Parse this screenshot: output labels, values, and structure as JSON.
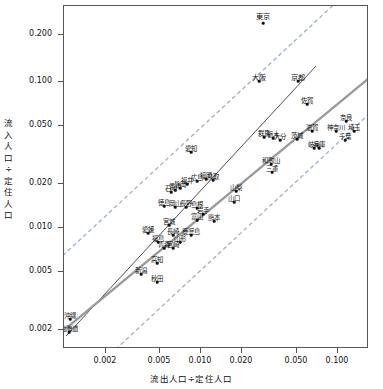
{
  "chart_data": {
    "type": "scatter",
    "title": "",
    "xlabel": "流出人口÷定住人口",
    "ylabel": "流入人口÷定住人口",
    "xscale": "log",
    "yscale": "log",
    "xlim": [
      0.0015,
      0.17
    ],
    "ylim": [
      0.0013,
      0.26
    ],
    "xticks": [
      "0.002",
      "0.005",
      "0.010",
      "0.020",
      "0.050",
      "0.100"
    ],
    "xtick_values": [
      0.002,
      0.005,
      0.01,
      0.02,
      0.05,
      0.1
    ],
    "yticks": [
      "0.200",
      "0.100",
      "0.050",
      "0.020",
      "0.010",
      "0.005",
      "0.002"
    ],
    "ytick_values": [
      0.2,
      0.1,
      0.05,
      0.02,
      0.01,
      0.005,
      0.002
    ],
    "grid": false,
    "legend": "none",
    "annotation": {
      "text": "相関係数: 0.852   p: 0.000 ***",
      "correlation": 0.852,
      "p_value": 0.0,
      "significance": "***"
    },
    "lines": [
      {
        "name": "regression-line",
        "style": "solid",
        "color": "#333333",
        "width": 0.9
      },
      {
        "name": "identity-line",
        "style": "solid",
        "color": "#9a9a9a",
        "width": 2.2
      },
      {
        "name": "upper-confidence-band",
        "style": "dashed",
        "color": "#9fb0c4",
        "width": 1.2
      },
      {
        "name": "lower-confidence-band",
        "style": "dashed",
        "color": "#9fb0c4",
        "width": 1.2
      }
    ],
    "points": [
      {
        "label": "東京",
        "x": 0.0215,
        "y": 0.23,
        "px": 262,
        "py": 22,
        "lx": 262,
        "ly": 15,
        "size": "big"
      },
      {
        "label": "大阪",
        "x": 0.0128,
        "y": 0.074,
        "px": 258,
        "py": 80,
        "lx": 258,
        "ly": 76,
        "size": "big"
      },
      {
        "label": "京都",
        "x": 0.0175,
        "y": 0.074,
        "px": 297,
        "py": 80,
        "lx": 297,
        "ly": 76,
        "size": "big"
      },
      {
        "label": "佐賀",
        "x": 0.0196,
        "y": 0.051,
        "px": 306,
        "py": 103,
        "lx": 306,
        "ly": 100,
        "size": "normal"
      },
      {
        "label": "奈良",
        "x": 0.052,
        "y": 0.034,
        "px": 345,
        "py": 120,
        "lx": 345,
        "ly": 117,
        "size": "normal"
      },
      {
        "label": "神奈川",
        "x": 0.047,
        "y": 0.03,
        "px": 335,
        "py": 130,
        "lx": 335,
        "ly": 127,
        "size": "normal"
      },
      {
        "label": "埼玉",
        "x": 0.053,
        "y": 0.03,
        "px": 353,
        "py": 130,
        "lx": 353,
        "ly": 127,
        "size": "normal"
      },
      {
        "label": "千葉",
        "x": 0.05,
        "y": 0.0272,
        "px": 344,
        "py": 139,
        "lx": 344,
        "ly": 136,
        "size": "normal"
      },
      {
        "label": "滋賀",
        "x": 0.023,
        "y": 0.03,
        "px": 311,
        "py": 130,
        "lx": 311,
        "ly": 127,
        "size": "normal"
      },
      {
        "label": "茨城",
        "x": 0.0195,
        "y": 0.0265,
        "px": 296,
        "py": 138,
        "lx": 296,
        "ly": 135,
        "size": "normal"
      },
      {
        "label": "岐阜",
        "x": 0.0225,
        "y": 0.024,
        "px": 313,
        "py": 147,
        "lx": 313,
        "ly": 144,
        "size": "normal"
      },
      {
        "label": "兵庫",
        "x": 0.0205,
        "y": 0.024,
        "px": 318,
        "py": 147,
        "lx": 318,
        "ly": 144,
        "size": "normal"
      },
      {
        "label": "群馬",
        "x": 0.0139,
        "y": 0.0262,
        "px": 263,
        "py": 136,
        "lx": 263,
        "ly": 133,
        "size": "normal"
      },
      {
        "label": "栃木",
        "x": 0.0152,
        "y": 0.0255,
        "px": 272,
        "py": 137,
        "lx": 272,
        "ly": 134,
        "size": "normal"
      },
      {
        "label": "大分",
        "x": 0.016,
        "y": 0.025,
        "px": 279,
        "py": 139,
        "lx": 279,
        "ly": 136,
        "size": "normal"
      },
      {
        "label": "和歌山",
        "x": 0.0128,
        "y": 0.019,
        "px": 270,
        "py": 163,
        "lx": 270,
        "ly": 160,
        "size": "normal"
      },
      {
        "label": "三重",
        "x": 0.013,
        "y": 0.0178,
        "px": 271,
        "py": 171,
        "lx": 271,
        "ly": 168,
        "size": "normal"
      },
      {
        "label": "愛知",
        "x": 0.0104,
        "y": 0.023,
        "px": 190,
        "py": 151,
        "lx": 190,
        "ly": 148,
        "size": "normal"
      },
      {
        "label": "山梨",
        "x": 0.0137,
        "y": 0.0145,
        "px": 235,
        "py": 190,
        "lx": 235,
        "ly": 187,
        "size": "normal"
      },
      {
        "label": "山口",
        "x": 0.013,
        "y": 0.0128,
        "px": 233,
        "py": 201,
        "lx": 233,
        "ly": 198,
        "size": "normal"
      },
      {
        "label": "福岡",
        "x": 0.0108,
        "y": 0.0155,
        "px": 205,
        "py": 178,
        "lx": 205,
        "ly": 175,
        "size": "normal"
      },
      {
        "label": "鳥取",
        "x": 0.0115,
        "y": 0.0152,
        "px": 212,
        "py": 179,
        "lx": 212,
        "ly": 176,
        "size": "normal"
      },
      {
        "label": "広島",
        "x": 0.0098,
        "y": 0.0148,
        "px": 196,
        "py": 180,
        "lx": 196,
        "ly": 177,
        "size": "normal"
      },
      {
        "label": "福井",
        "x": 0.0093,
        "y": 0.014,
        "px": 186,
        "py": 183,
        "lx": 186,
        "ly": 180,
        "size": "normal"
      },
      {
        "label": "静岡",
        "x": 0.0092,
        "y": 0.0133,
        "px": 179,
        "py": 187,
        "lx": 179,
        "ly": 184,
        "size": "normal"
      },
      {
        "label": "香川",
        "x": 0.0088,
        "y": 0.013,
        "px": 174,
        "py": 189,
        "lx": 174,
        "ly": 186,
        "size": "normal"
      },
      {
        "label": "石川",
        "x": 0.0086,
        "y": 0.0126,
        "px": 170,
        "py": 191,
        "lx": 170,
        "ly": 188,
        "size": "normal"
      },
      {
        "label": "徳島",
        "x": 0.0096,
        "y": 0.0118,
        "px": 163,
        "py": 205,
        "lx": 163,
        "ly": 202,
        "size": "normal"
      },
      {
        "label": "岡山",
        "x": 0.0101,
        "y": 0.0116,
        "px": 174,
        "py": 206,
        "lx": 174,
        "ly": 203,
        "size": "normal"
      },
      {
        "label": "長野",
        "x": 0.0105,
        "y": 0.0114,
        "px": 185,
        "py": 206,
        "lx": 185,
        "ly": 203,
        "size": "normal"
      },
      {
        "label": "島根",
        "x": 0.011,
        "y": 0.0112,
        "px": 196,
        "py": 207,
        "lx": 196,
        "ly": 204,
        "size": "normal"
      },
      {
        "label": "岩手",
        "x": 0.0112,
        "y": 0.0104,
        "px": 202,
        "py": 213,
        "lx": 202,
        "ly": 210,
        "size": "normal"
      },
      {
        "label": "富山",
        "x": 0.0109,
        "y": 0.0097,
        "px": 196,
        "py": 219,
        "lx": 196,
        "ly": 216,
        "size": "normal"
      },
      {
        "label": "熊本",
        "x": 0.0118,
        "y": 0.0095,
        "px": 213,
        "py": 220,
        "lx": 213,
        "ly": 217,
        "size": "normal"
      },
      {
        "label": "宮城",
        "x": 0.009,
        "y": 0.009,
        "px": 168,
        "py": 224,
        "lx": 168,
        "ly": 221,
        "size": "normal"
      },
      {
        "label": "愛媛",
        "x": 0.0072,
        "y": 0.0077,
        "px": 147,
        "py": 232,
        "lx": 147,
        "ly": 229,
        "size": "normal"
      },
      {
        "label": "長崎",
        "x": 0.0082,
        "y": 0.0074,
        "px": 172,
        "py": 234,
        "lx": 172,
        "ly": 231,
        "size": "normal"
      },
      {
        "label": "鹿児島",
        "x": 0.009,
        "y": 0.0073,
        "px": 190,
        "py": 234,
        "lx": 190,
        "ly": 231,
        "size": "normal"
      },
      {
        "label": "福島",
        "x": 0.0076,
        "y": 0.0066,
        "px": 157,
        "py": 241,
        "lx": 157,
        "ly": 238,
        "size": "normal"
      },
      {
        "label": "山形",
        "x": 0.0086,
        "y": 0.0065,
        "px": 179,
        "py": 241,
        "lx": 179,
        "ly": 238,
        "size": "normal"
      },
      {
        "label": "青森",
        "x": 0.0078,
        "y": 0.006,
        "px": 163,
        "py": 247,
        "lx": 163,
        "ly": 244,
        "size": "normal"
      },
      {
        "label": "宮崎",
        "x": 0.0082,
        "y": 0.0059,
        "px": 172,
        "py": 247,
        "lx": 172,
        "ly": 244,
        "size": "normal"
      },
      {
        "label": "高知",
        "x": 0.0072,
        "y": 0.0046,
        "px": 156,
        "py": 262,
        "lx": 156,
        "ly": 259,
        "size": "normal"
      },
      {
        "label": "新潟",
        "x": 0.0062,
        "y": 0.0038,
        "px": 140,
        "py": 273,
        "lx": 140,
        "ly": 270,
        "size": "normal"
      },
      {
        "label": "秋田",
        "x": 0.0068,
        "y": 0.0033,
        "px": 156,
        "py": 281,
        "lx": 156,
        "ly": 278,
        "size": "normal"
      },
      {
        "label": "沖縄",
        "x": 0.002,
        "y": 0.0019,
        "px": 69,
        "py": 318,
        "lx": 69,
        "ly": 315,
        "size": "normal"
      },
      {
        "label": "北海道",
        "x": 0.0019,
        "y": 0.0016,
        "px": 68,
        "py": 331,
        "lx": 68,
        "ly": 328,
        "size": "normal"
      }
    ]
  },
  "axes": {
    "x": {
      "title": "流出人口÷定住人口",
      "ticks": [
        {
          "label": "0.002",
          "px": 105
        },
        {
          "label": "0.005",
          "px": 159
        },
        {
          "label": "0.010",
          "px": 200
        },
        {
          "label": "0.020",
          "px": 241
        },
        {
          "label": "0.050",
          "px": 296
        },
        {
          "label": "0.100",
          "px": 337
        }
      ]
    },
    "y": {
      "title_chars": [
        "流",
        "入",
        "人",
        "口",
        "÷",
        "定",
        "住",
        "人",
        "口"
      ],
      "ticks": [
        {
          "label": "0.200",
          "py": 34
        },
        {
          "label": "0.100",
          "py": 81
        },
        {
          "label": "0.050",
          "py": 125
        },
        {
          "label": "0.020",
          "py": 183
        },
        {
          "label": "0.010",
          "py": 227
        },
        {
          "label": "0.005",
          "py": 271
        },
        {
          "label": "0.002",
          "py": 329
        }
      ]
    }
  }
}
